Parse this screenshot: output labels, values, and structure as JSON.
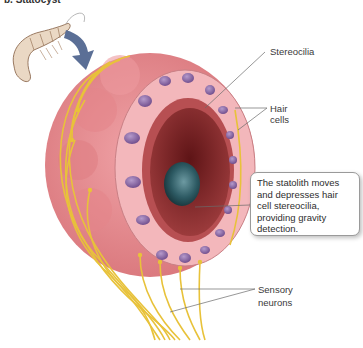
{
  "figure": {
    "top_cut_text": "b. Statocyst",
    "labels": {
      "stereocilia": "Stereocilia",
      "hair_cells_line1": "Hair",
      "hair_cells_line2": "cells",
      "sensory_neurons_line1": "Sensory",
      "sensory_neurons_line2": "neurons"
    },
    "callout": {
      "text": "The statolith moves and depresses hair cell stereocilia, providing gravity detection."
    },
    "colors": {
      "outer_tissue": "#e58a8e",
      "hair_cell": "#f3b7bb",
      "nucleus": "#8e6aa6",
      "lumen": "#7a1f22",
      "statolith": "#2e5a63",
      "nerve": "#e8c23a",
      "arrow": "#5b6f96",
      "leader_line": "#6a6a6a"
    }
  }
}
